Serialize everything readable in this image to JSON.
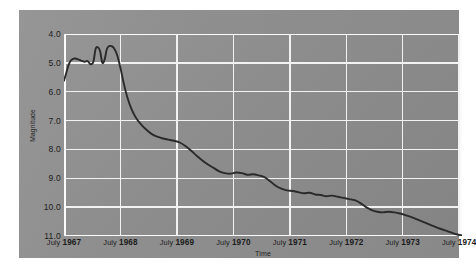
{
  "chart_data": {
    "type": "line",
    "title": "",
    "xlabel": "Time",
    "ylabel": "Magnitude",
    "y_inverted": true,
    "ylim": [
      4.0,
      11.0
    ],
    "yticks": [
      "4.0",
      "5.0",
      "6.0",
      "7.0",
      "8.0",
      "9.0",
      "10.0",
      "11.0"
    ],
    "ytick_values": [
      4.0,
      5.0,
      6.0,
      7.0,
      8.0,
      9.0,
      10.0,
      11.0
    ],
    "xticks": [
      "July 1967",
      "July 1968",
      "July 1969",
      "July 1970",
      "July 1971",
      "July 1972",
      "July 1973",
      "July 1974"
    ],
    "xtick_values": [
      1967.5,
      1968.5,
      1969.5,
      1970.5,
      1971.5,
      1972.5,
      1973.5,
      1974.5
    ],
    "xlim": [
      1967.5,
      1974.55
    ],
    "grid": true,
    "legend": null,
    "series": [
      {
        "name": "Magnitude",
        "color": "#2a2a2a",
        "x": [
          1967.5,
          1967.54,
          1967.58,
          1967.62,
          1967.66,
          1967.7,
          1967.75,
          1967.8,
          1967.86,
          1967.92,
          1967.97,
          1968.02,
          1968.06,
          1968.1,
          1968.14,
          1968.18,
          1968.22,
          1968.26,
          1968.3,
          1968.34,
          1968.38,
          1968.44,
          1968.5,
          1968.56,
          1968.62,
          1968.7,
          1968.78,
          1968.86,
          1968.95,
          1969.05,
          1969.15,
          1969.25,
          1969.35,
          1969.45,
          1969.55,
          1969.65,
          1969.75,
          1969.85,
          1969.95,
          1970.05,
          1970.15,
          1970.25,
          1970.35,
          1970.45,
          1970.55,
          1970.65,
          1970.75,
          1970.85,
          1970.95,
          1971.05,
          1971.15,
          1971.25,
          1971.35,
          1971.45,
          1971.55,
          1971.65,
          1971.75,
          1971.85,
          1971.95,
          1972.05,
          1972.15,
          1972.25,
          1972.35,
          1972.45,
          1972.55,
          1972.65,
          1972.75,
          1972.85,
          1972.95,
          1973.05,
          1973.15,
          1973.25,
          1973.35,
          1973.45,
          1973.55,
          1973.7,
          1973.85,
          1974.0,
          1974.15,
          1974.3,
          1974.45,
          1974.55
        ],
        "y": [
          5.62,
          5.35,
          5.08,
          4.92,
          4.86,
          4.85,
          4.88,
          4.92,
          4.96,
          4.94,
          5.05,
          4.96,
          4.52,
          4.46,
          4.6,
          5.0,
          4.88,
          4.52,
          4.42,
          4.42,
          4.48,
          4.72,
          5.18,
          5.72,
          6.18,
          6.62,
          6.92,
          7.12,
          7.3,
          7.46,
          7.56,
          7.62,
          7.66,
          7.7,
          7.76,
          7.88,
          8.04,
          8.22,
          8.38,
          8.52,
          8.64,
          8.76,
          8.82,
          8.84,
          8.8,
          8.82,
          8.88,
          8.86,
          8.9,
          8.96,
          9.1,
          9.26,
          9.36,
          9.42,
          9.44,
          9.48,
          9.52,
          9.5,
          9.56,
          9.58,
          9.62,
          9.6,
          9.64,
          9.68,
          9.72,
          9.76,
          9.86,
          10.0,
          10.1,
          10.16,
          10.18,
          10.16,
          10.18,
          10.22,
          10.28,
          10.38,
          10.5,
          10.62,
          10.74,
          10.84,
          10.94,
          10.98
        ]
      }
    ]
  }
}
